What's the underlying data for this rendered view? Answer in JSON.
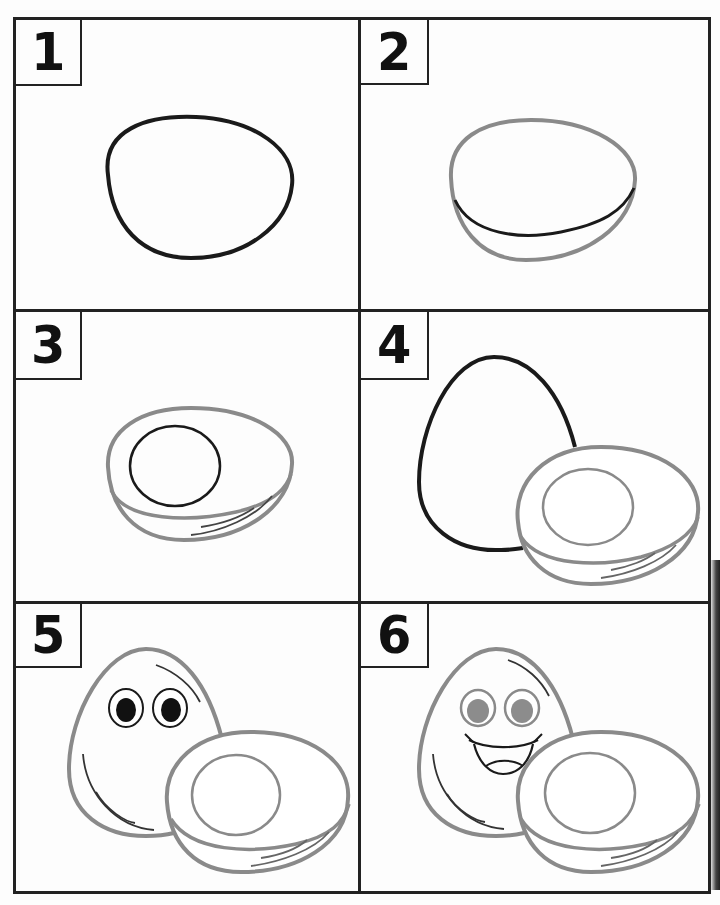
{
  "colors": {
    "border": "#222222",
    "outline_dark": "#1a1a1a",
    "outline_gray": "#8a8a8a",
    "pupil_dark": "#111111",
    "pupil_gray": "#8c8c8c"
  },
  "steps": [
    {
      "number": "1",
      "description": "Draw a rounded egg-half outline"
    },
    {
      "number": "2",
      "description": "Add a curved line for the shell thickness"
    },
    {
      "number": "3",
      "description": "Draw the yolk circle and shine lines"
    },
    {
      "number": "4",
      "description": "Draw a whole egg behind the half"
    },
    {
      "number": "5",
      "description": "Add eyes and shine lines to the whole egg"
    },
    {
      "number": "6",
      "description": "Add a smiling mouth and color the eyes"
    }
  ]
}
